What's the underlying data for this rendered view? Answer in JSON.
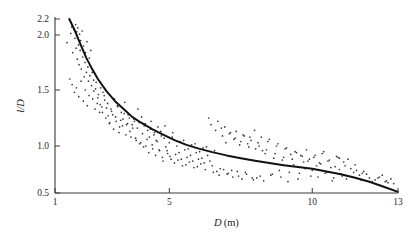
{
  "chart_data": {
    "type": "scatter",
    "title": "",
    "subtitle": "",
    "xlabel": "D (m)",
    "xlabel_symbol": "D",
    "xlabel_unit": "(m)",
    "ylabel": "l/D",
    "xlim": [
      1,
      13
    ],
    "ylim": [
      0.5,
      2.2
    ],
    "xticks": [
      1,
      5,
      10,
      13
    ],
    "xtick_labels": [
      "1",
      "5",
      "10",
      "13"
    ],
    "yticks": [
      0.5,
      1.0,
      1.5,
      2.0,
      2.2
    ],
    "ytick_labels": [
      "0.5",
      "1.0",
      "1.5",
      "2.0",
      "2.2"
    ],
    "grid": false,
    "legend": false,
    "legend_position": "none",
    "point_color": "#3a3a3a",
    "curve_color": "#111111",
    "axis_color": "#3b3b3b",
    "background_color": "#ffffff",
    "series": [
      {
        "name": "fitted curve",
        "type": "line",
        "description": "monotonically decreasing hyperbolic fit",
        "x": [
          1.5,
          1.7,
          1.9,
          2.1,
          2.3,
          2.5,
          2.8,
          3.1,
          3.4,
          3.7,
          4.0,
          4.4,
          4.8,
          5.2,
          5.6,
          6.0,
          6.5,
          7.0,
          7.5,
          8.0,
          8.5,
          9.0,
          9.5,
          10.0,
          10.5,
          11.0,
          11.5,
          12.0,
          12.5,
          13.0
        ],
        "y": [
          2.2,
          2.05,
          1.91,
          1.79,
          1.69,
          1.6,
          1.49,
          1.4,
          1.33,
          1.26,
          1.21,
          1.15,
          1.1,
          1.05,
          1.01,
          0.975,
          0.935,
          0.9,
          0.87,
          0.843,
          0.818,
          0.796,
          0.776,
          0.757,
          0.729,
          0.7,
          0.663,
          0.62,
          0.566,
          0.512
        ]
      },
      {
        "name": "observations",
        "type": "scatter",
        "n_points": 283,
        "x": [
          1.42,
          1.55,
          1.58,
          1.62,
          1.66,
          1.7,
          1.72,
          1.74,
          1.76,
          1.78,
          1.8,
          1.82,
          1.84,
          1.86,
          1.88,
          1.9,
          1.92,
          1.95,
          1.97,
          2.0,
          2.02,
          2.05,
          2.07,
          2.1,
          2.12,
          2.15,
          2.17,
          2.2,
          2.22,
          2.25,
          1.52,
          1.6,
          1.68,
          1.75,
          1.83,
          1.91,
          1.99,
          2.06,
          2.13,
          2.19,
          2.28,
          2.32,
          2.36,
          2.4,
          2.44,
          2.48,
          2.52,
          2.56,
          2.6,
          2.64,
          2.3,
          2.35,
          2.42,
          2.5,
          2.58,
          2.66,
          2.72,
          2.78,
          2.84,
          2.9,
          2.96,
          3.02,
          3.08,
          3.14,
          3.2,
          3.26,
          3.32,
          3.38,
          3.44,
          3.5,
          2.68,
          2.74,
          2.8,
          2.86,
          2.92,
          2.98,
          3.05,
          3.12,
          3.18,
          3.24,
          3.3,
          3.36,
          3.42,
          3.48,
          3.54,
          3.6,
          3.66,
          3.72,
          3.78,
          3.84,
          3.56,
          3.62,
          3.7,
          3.76,
          3.82,
          3.88,
          3.94,
          4.0,
          4.06,
          4.12,
          4.18,
          4.24,
          4.3,
          4.36,
          4.42,
          4.48,
          4.54,
          4.6,
          4.66,
          4.72,
          3.9,
          3.96,
          4.03,
          4.1,
          4.16,
          4.22,
          4.28,
          4.34,
          4.4,
          4.46,
          4.52,
          4.58,
          4.64,
          4.7,
          4.76,
          4.82,
          4.88,
          4.94,
          5.0,
          5.06,
          4.78,
          4.85,
          4.92,
          5.02,
          5.1,
          5.18,
          5.26,
          5.34,
          5.42,
          5.5,
          5.58,
          5.66,
          5.74,
          5.82,
          5.9,
          5.98,
          6.06,
          6.14,
          6.22,
          6.3,
          5.12,
          5.22,
          5.3,
          5.38,
          5.46,
          5.54,
          5.62,
          5.7,
          5.78,
          5.86,
          5.94,
          6.02,
          6.1,
          6.18,
          6.26,
          6.34,
          6.42,
          6.5,
          6.58,
          6.66,
          6.38,
          6.46,
          6.54,
          6.62,
          6.7,
          6.78,
          6.86,
          6.94,
          7.02,
          7.1,
          7.18,
          7.26,
          7.34,
          7.42,
          7.5,
          7.58,
          7.66,
          7.74,
          7.82,
          7.9,
          6.74,
          6.82,
          6.9,
          6.98,
          7.06,
          7.14,
          7.22,
          7.3,
          7.38,
          7.46,
          7.54,
          7.62,
          7.7,
          7.78,
          7.86,
          7.94,
          8.02,
          8.1,
          8.18,
          8.26,
          7.98,
          8.06,
          8.14,
          8.22,
          8.3,
          8.4,
          8.5,
          8.6,
          8.7,
          8.8,
          8.9,
          9.0,
          9.1,
          9.2,
          9.3,
          9.4,
          9.5,
          9.6,
          9.7,
          9.8,
          8.35,
          8.45,
          8.55,
          8.65,
          8.75,
          8.85,
          8.95,
          9.05,
          9.15,
          9.25,
          9.35,
          9.45,
          9.55,
          9.65,
          9.75,
          9.85,
          9.95,
          10.05,
          10.15,
          10.25,
          9.9,
          10.0,
          10.1,
          10.2,
          10.3,
          10.4,
          10.5,
          10.6,
          10.7,
          10.8,
          10.9,
          11.0,
          11.1,
          11.2,
          11.35,
          11.5,
          11.65,
          11.8,
          12.0,
          12.2,
          10.35,
          10.45,
          10.55,
          10.65,
          10.75,
          10.85,
          10.95,
          11.05,
          11.25,
          11.45,
          11.7,
          11.9,
          12.1,
          12.35,
          12.6,
          12.75,
          12.85,
          12.45,
          11.15,
          10.95,
          12.3,
          12.55,
          12.65,
          11.55,
          11.75
        ],
        "y": [
          1.93,
          2.02,
          2.1,
          1.84,
          2.07,
          1.97,
          2.13,
          1.88,
          2.04,
          1.78,
          2.09,
          1.91,
          1.73,
          2.01,
          1.86,
          1.95,
          1.69,
          2.05,
          1.8,
          1.9,
          1.62,
          1.75,
          1.84,
          1.66,
          1.94,
          1.71,
          1.58,
          1.79,
          1.63,
          1.86,
          1.6,
          1.55,
          1.48,
          1.52,
          1.44,
          1.58,
          1.4,
          1.5,
          1.36,
          1.45,
          1.54,
          1.42,
          1.49,
          1.33,
          1.57,
          1.38,
          1.46,
          1.3,
          1.52,
          1.35,
          1.66,
          1.59,
          1.51,
          1.43,
          1.37,
          1.3,
          1.45,
          1.25,
          1.38,
          1.2,
          1.33,
          1.28,
          1.42,
          1.22,
          1.35,
          1.17,
          1.3,
          1.24,
          1.39,
          1.19,
          1.48,
          1.41,
          1.34,
          1.27,
          1.21,
          1.31,
          1.15,
          1.26,
          1.36,
          1.12,
          1.23,
          1.18,
          1.29,
          1.1,
          1.2,
          1.25,
          1.08,
          1.16,
          1.22,
          1.05,
          1.28,
          1.13,
          1.19,
          1.24,
          1.07,
          1.16,
          1.21,
          1.03,
          1.11,
          1.18,
          1.0,
          1.14,
          1.08,
          1.22,
          0.97,
          1.12,
          1.05,
          1.17,
          0.95,
          1.09,
          1.33,
          1.02,
          1.26,
          0.99,
          1.2,
          1.06,
          0.93,
          1.15,
          1.01,
          1.1,
          0.9,
          1.04,
          0.96,
          1.13,
          0.88,
          1.07,
          0.99,
          0.92,
          1.03,
          0.86,
          0.84,
          1.18,
          0.95,
          0.89,
          1.08,
          0.82,
          1.0,
          0.93,
          0.86,
          1.05,
          0.8,
          0.97,
          0.9,
          0.84,
          1.02,
          0.78,
          0.94,
          0.87,
          0.82,
          0.99,
          1.12,
          0.91,
          0.85,
          1.04,
          0.79,
          0.96,
          0.88,
          0.83,
          1.01,
          0.77,
          0.93,
          0.86,
          0.81,
          0.98,
          0.75,
          0.9,
          0.84,
          0.79,
          0.95,
          0.73,
          1.25,
          1.19,
          0.72,
          1.14,
          1.22,
          0.76,
          1.09,
          1.17,
          0.7,
          1.11,
          0.74,
          1.06,
          1.13,
          0.68,
          1.04,
          1.1,
          0.72,
          1.02,
          1.08,
          0.66,
          0.69,
          1.16,
          0.75,
          1.03,
          0.71,
          1.12,
          0.67,
          1.07,
          0.73,
          1.01,
          0.65,
          1.09,
          0.7,
          0.99,
          1.05,
          0.64,
          0.97,
          1.03,
          0.68,
          0.95,
          1.14,
          0.66,
          1.0,
          1.08,
          0.63,
          0.96,
          1.06,
          0.7,
          0.92,
          1.02,
          0.67,
          0.88,
          0.98,
          0.72,
          0.86,
          0.94,
          0.65,
          0.9,
          0.83,
          0.96,
          0.92,
          1.04,
          0.69,
          0.87,
          1.0,
          0.74,
          0.85,
          0.97,
          0.62,
          0.91,
          0.8,
          0.93,
          0.71,
          0.89,
          0.76,
          0.84,
          0.68,
          0.88,
          0.79,
          0.82,
          0.86,
          0.74,
          0.9,
          0.67,
          0.81,
          0.94,
          0.72,
          0.85,
          0.63,
          0.78,
          0.88,
          0.7,
          0.83,
          0.65,
          0.76,
          0.8,
          0.69,
          0.73,
          0.66,
          0.64,
          0.92,
          0.71,
          0.84,
          0.77,
          0.66,
          0.89,
          0.75,
          0.68,
          0.86,
          0.72,
          0.64,
          0.7,
          0.62,
          0.67,
          0.63,
          0.65,
          0.6,
          0.69,
          0.79,
          0.87,
          0.66,
          0.62,
          0.61,
          0.74,
          0.71
        ]
      }
    ]
  },
  "figure": {
    "caption": "",
    "alt": "Scatter plot of l/D versus D (m) with fitted decreasing curve"
  }
}
